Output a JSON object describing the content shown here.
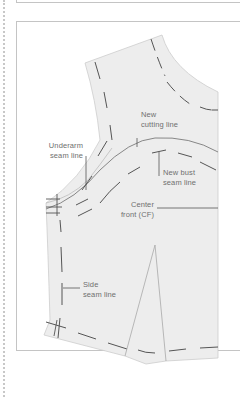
{
  "diagram": {
    "labels": {
      "new_cutting_line": [
        "New",
        "cutting line"
      ],
      "underarm_seam_line": [
        "Underarm",
        "seam line"
      ],
      "new_bust_seam_line": [
        "New bust",
        "seam line"
      ],
      "center_front": [
        "Center",
        "front (CF)"
      ],
      "side_seam_line": [
        "Side",
        "seam line"
      ]
    },
    "colors": {
      "pattern_fill": "#ededed",
      "pattern_edge": "#c9c9c9",
      "seam_dash": "#555555",
      "leader_line": "#555555",
      "label_text": "#6f6f6f",
      "frame": "#c4c4c4"
    }
  }
}
